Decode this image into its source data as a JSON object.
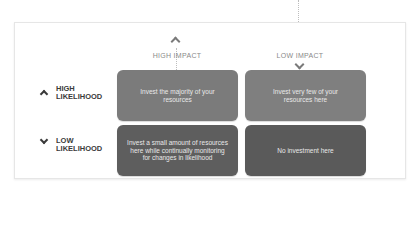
{
  "matrix": {
    "columns": [
      {
        "label": "HIGH IMPACT",
        "arrow": "up"
      },
      {
        "label": "LOW IMPACT",
        "arrow": "down"
      }
    ],
    "rows": [
      {
        "label_line1": "HIGH",
        "label_line2": "LIKELIHOOD",
        "arrow": "up"
      },
      {
        "label_line1": "LOW",
        "label_line2": "LIKELIHOOD",
        "arrow": "down"
      }
    ],
    "cells": [
      {
        "text": "Invest the majority of your resources",
        "color": "#7b7b7b"
      },
      {
        "text": "Invest very few of your resources here",
        "color": "#7f7f7f"
      },
      {
        "text": "Invest a small amount of resources here while continually monitoring for changes in likelihood",
        "color": "#5e5e5e"
      },
      {
        "text": "No investment here",
        "color": "#5a5a5a"
      }
    ]
  },
  "colors": {
    "panel_border": "#e6e6e6",
    "header_text": "#8a8a8a",
    "row_label_text": "#3a3a3a"
  }
}
